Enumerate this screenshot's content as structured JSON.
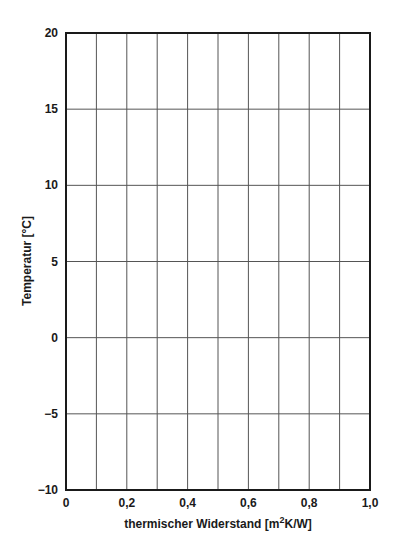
{
  "chart_data": {
    "type": "line",
    "title": "",
    "xlabel": "thermischer Widerstand  [m²K/W]",
    "xlabel_main": "thermischer Widerstand  [m",
    "xlabel_sup": "2",
    "xlabel_tail": "K/W]",
    "ylabel": "Temperatur  [°C]",
    "xlim": [
      0,
      1.0
    ],
    "ylim": [
      -10,
      20
    ],
    "x_ticks": [
      0,
      0.2,
      0.4,
      0.6,
      0.8,
      1.0
    ],
    "x_tick_labels": [
      "0",
      "0,2",
      "0,4",
      "0,6",
      "0,8",
      "1,0"
    ],
    "x_grid_step": 0.1,
    "y_ticks": [
      -10,
      -5,
      0,
      5,
      10,
      15,
      20
    ],
    "y_tick_labels": [
      "−10",
      "−5",
      "0",
      "5",
      "10",
      "15",
      "20"
    ],
    "grid": true,
    "legend": null,
    "series": []
  },
  "layout": {
    "plot_left": 66,
    "plot_top": 33,
    "plot_right": 370,
    "plot_bottom": 490
  }
}
